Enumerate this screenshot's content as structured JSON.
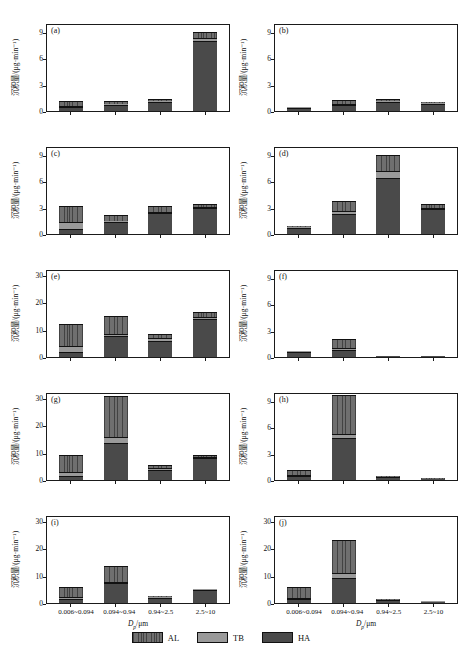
{
  "figure": {
    "axis": {
      "ylabel": "沉积量/(μg·min⁻¹)",
      "xlabel_main": "D",
      "xlabel_sub": "p",
      "xlabel_unit": "/μm"
    },
    "categories": [
      "0.006~0.094",
      "0.094~0.94",
      "0.94~2.5",
      "2.5~10"
    ],
    "legend": [
      {
        "key": "al",
        "label": "AL",
        "color": "#6f6f6f",
        "pattern": "vertical-hatch"
      },
      {
        "key": "tb",
        "label": "TB",
        "color": "#9a9a9a",
        "pattern": "solid"
      },
      {
        "key": "ha",
        "label": "HA",
        "color": "#4a4a4a",
        "pattern": "solid"
      }
    ]
  },
  "chart_data": [
    {
      "type": "bar",
      "panel": "(a)",
      "title": "",
      "xlabel": "Dp /μm",
      "ylabel": "沉积量/(μg·min⁻¹)",
      "ylim": [
        0,
        10
      ],
      "yticks": [
        0,
        3,
        6,
        9
      ],
      "grid": false,
      "stacked": true,
      "categories": [
        "0.006~0.094",
        "0.094~0.94",
        "0.94~2.5",
        "2.5~10"
      ],
      "series": [
        {
          "name": "HA",
          "values": [
            0.45,
            0.7,
            1.0,
            7.95
          ]
        },
        {
          "name": "TB",
          "values": [
            0.15,
            0.1,
            0.1,
            0.3
          ]
        },
        {
          "name": "AL",
          "values": [
            0.5,
            0.3,
            0.3,
            0.75
          ]
        }
      ],
      "totals": [
        1.1,
        1.1,
        1.4,
        9.0
      ]
    },
    {
      "type": "bar",
      "panel": "(b)",
      "ylim": [
        0,
        10
      ],
      "yticks": [
        0,
        3,
        6,
        9
      ],
      "grid": false,
      "stacked": true,
      "categories": [
        "0.006~0.094",
        "0.094~0.94",
        "0.94~2.5",
        "2.5~10"
      ],
      "series": [
        {
          "name": "HA",
          "values": [
            0.35,
            0.7,
            1.05,
            0.85
          ]
        },
        {
          "name": "TB",
          "values": [
            0.03,
            0.15,
            0.12,
            0.05
          ]
        },
        {
          "name": "AL",
          "values": [
            0.02,
            0.35,
            0.23,
            0.1
          ]
        }
      ],
      "totals": [
        0.4,
        1.2,
        1.4,
        1.0
      ]
    },
    {
      "type": "bar",
      "panel": "(c)",
      "ylim": [
        0,
        10
      ],
      "yticks": [
        0,
        3,
        6,
        9
      ],
      "grid": false,
      "stacked": true,
      "categories": [
        "0.006~0.094",
        "0.094~0.94",
        "0.94~2.5",
        "2.5~10"
      ],
      "series": [
        {
          "name": "HA",
          "values": [
            0.6,
            1.35,
            2.35,
            2.95
          ]
        },
        {
          "name": "TB",
          "values": [
            0.75,
            0.1,
            0.2,
            0.15
          ]
        },
        {
          "name": "AL",
          "values": [
            1.85,
            0.75,
            0.65,
            0.35
          ]
        }
      ],
      "totals": [
        3.2,
        2.2,
        3.2,
        3.45
      ]
    },
    {
      "type": "bar",
      "panel": "(d)",
      "ylim": [
        0,
        10
      ],
      "yticks": [
        0,
        3,
        6,
        9
      ],
      "grid": false,
      "stacked": true,
      "categories": [
        "0.006~0.094",
        "0.094~0.94",
        "0.94~2.5",
        "2.5~10"
      ],
      "series": [
        {
          "name": "HA",
          "values": [
            0.72,
            2.3,
            6.4,
            2.8
          ]
        },
        {
          "name": "TB",
          "values": [
            0.05,
            0.35,
            0.75,
            0.2
          ]
        },
        {
          "name": "AL",
          "values": [
            0.03,
            1.15,
            1.85,
            0.4
          ]
        }
      ],
      "totals": [
        0.8,
        3.8,
        9.0,
        3.4
      ]
    },
    {
      "type": "bar",
      "panel": "(e)",
      "ylim": [
        0,
        32
      ],
      "yticks": [
        0,
        10,
        20,
        30
      ],
      "grid": false,
      "stacked": true,
      "categories": [
        "0.006~0.094",
        "0.094~0.94",
        "0.94~2.5",
        "2.5~10"
      ],
      "series": [
        {
          "name": "HA",
          "values": [
            1.8,
            7.6,
            6.0,
            13.8
          ]
        },
        {
          "name": "TB",
          "values": [
            2.3,
            0.9,
            0.8,
            0.9
          ]
        },
        {
          "name": "AL",
          "values": [
            7.9,
            6.5,
            1.7,
            1.6
          ]
        }
      ],
      "totals": [
        12.0,
        15.0,
        8.5,
        16.3
      ]
    },
    {
      "type": "bar",
      "panel": "(f)",
      "ylim": [
        0,
        10
      ],
      "yticks": [
        0,
        3,
        6,
        9
      ],
      "grid": false,
      "stacked": true,
      "categories": [
        "0.006~0.094",
        "0.094~0.94",
        "0.94~2.5",
        "2.5~10"
      ],
      "series": [
        {
          "name": "HA",
          "values": [
            0.6,
            0.85,
            0.02,
            0.02
          ]
        },
        {
          "name": "TB",
          "values": [
            0.05,
            0.2,
            0.0,
            0.0
          ]
        },
        {
          "name": "AL",
          "values": [
            0.05,
            0.95,
            0.0,
            0.0
          ]
        }
      ],
      "totals": [
        0.7,
        2.0,
        0.02,
        0.02
      ]
    },
    {
      "type": "bar",
      "panel": "(g)",
      "ylim": [
        0,
        32
      ],
      "yticks": [
        0,
        10,
        20,
        30
      ],
      "grid": false,
      "stacked": true,
      "categories": [
        "0.006~0.094",
        "0.094~0.94",
        "0.94~2.5",
        "2.5~10"
      ],
      "series": [
        {
          "name": "HA",
          "values": [
            1.4,
            13.6,
            3.8,
            7.9
          ]
        },
        {
          "name": "TB",
          "values": [
            1.5,
            2.2,
            0.6,
            0.5
          ]
        },
        {
          "name": "AL",
          "values": [
            6.1,
            14.7,
            0.9,
            0.8
          ]
        }
      ],
      "totals": [
        9.0,
        30.5,
        5.3,
        9.2
      ]
    },
    {
      "type": "bar",
      "panel": "(h)",
      "ylim": [
        0,
        10
      ],
      "yticks": [
        0,
        3,
        6,
        9
      ],
      "grid": false,
      "stacked": true,
      "categories": [
        "0.006~0.094",
        "0.094~0.94",
        "0.94~2.5",
        "2.5~10"
      ],
      "series": [
        {
          "name": "HA",
          "values": [
            0.4,
            4.75,
            0.3,
            0.08
          ]
        },
        {
          "name": "TB",
          "values": [
            0.15,
            0.45,
            0.05,
            0.02
          ]
        },
        {
          "name": "AL",
          "values": [
            0.55,
            4.5,
            0.05,
            0.02
          ]
        }
      ],
      "totals": [
        1.1,
        9.7,
        0.4,
        0.12
      ]
    },
    {
      "type": "bar",
      "panel": "(i)",
      "ylim": [
        0,
        32
      ],
      "yticks": [
        0,
        10,
        20,
        30
      ],
      "grid": false,
      "stacked": true,
      "categories": [
        "0.006~0.094",
        "0.094~0.94",
        "0.94~2.5",
        "2.5~10"
      ],
      "series": [
        {
          "name": "HA",
          "values": [
            1.3,
            7.1,
            2.0,
            4.8
          ]
        },
        {
          "name": "TB",
          "values": [
            0.8,
            0.7,
            0.3,
            0.25
          ]
        },
        {
          "name": "AL",
          "values": [
            3.7,
            5.7,
            0.3,
            0.15
          ]
        }
      ],
      "totals": [
        5.8,
        13.5,
        2.6,
        5.2
      ]
    },
    {
      "type": "bar",
      "panel": "(j)",
      "ylim": [
        0,
        32
      ],
      "yticks": [
        0,
        10,
        20,
        30
      ],
      "grid": false,
      "stacked": true,
      "categories": [
        "0.006~0.094",
        "0.094~0.94",
        "0.94~2.5",
        "2.5~10"
      ],
      "series": [
        {
          "name": "HA",
          "values": [
            1.3,
            9.1,
            1.05,
            0.35
          ]
        },
        {
          "name": "TB",
          "values": [
            0.5,
            1.8,
            0.15,
            0.08
          ]
        },
        {
          "name": "AL",
          "values": [
            4.2,
            12.1,
            0.1,
            0.02
          ]
        }
      ],
      "totals": [
        6.0,
        23.0,
        1.3,
        0.45
      ]
    }
  ]
}
